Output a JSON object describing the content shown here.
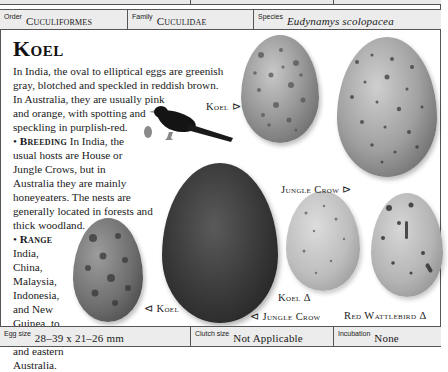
{
  "header": {
    "order_label": "Order",
    "order_value": "Cuculiformes",
    "family_label": "Family",
    "family_value": "Cuculidae",
    "species_label": "Species",
    "species_value": "Eudynamys scolopacea"
  },
  "article": {
    "title": "Koel",
    "intro": "In India, the oval to elliptical eggs are greenish gray, blotched and speckled in reddish brown. In Australia, they are usually pink and orange, with spotting and speckling in purplish-red.",
    "intro_lines": [
      "In India, the oval to elliptical eggs are greenish",
      "gray, blotched and speckled in reddish brown.",
      "In Australia, they are usually pink",
      "and orange, with spotting and",
      "speckling in purplish-red."
    ],
    "breeding_heading": "Breeding",
    "breeding_lines": [
      " In India, the",
      "usual hosts are House or",
      "Jungle Crows, but in",
      "Australia they are mainly",
      "honeyeaters. The nests are",
      "generally located in forests and",
      "thick woodland."
    ],
    "range_heading": "Range",
    "range_lines": [
      "India,",
      "China,",
      "Malaysia,",
      "Indonesia,",
      "and New",
      "Guinea, to",
      "northern",
      "and eastern",
      "Australia."
    ],
    "bullet": "•"
  },
  "egg_labels": {
    "koel_top": "Koel ⊳",
    "jungle_crow_top": "Jungle Crow ⊳",
    "koel_bottom_left": "⊲ Koel",
    "jungle_crow_bottom": "⊲ Jungle Crow",
    "koel_bottom": "Koel Δ",
    "red_wattlebird": "Red Wattlebird Δ"
  },
  "footer": {
    "egg_size_label": "Egg size",
    "egg_size_value": "28–39 x 21–26 mm",
    "clutch_size_label": "Clutch size",
    "clutch_size_value": "Not Applicable",
    "incubation_label": "Incubation",
    "incubation_value": "None"
  },
  "colors": {
    "border": "#555555",
    "bar_bg": "#ececec",
    "text": "#1a1a1a"
  }
}
